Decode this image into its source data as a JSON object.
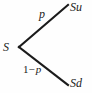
{
  "diagram": {
    "type": "binomial-one-step-tree",
    "background_color": "#fefefe",
    "line_color": "#1b1b1b",
    "text_color": "#1b1b1b",
    "nodes": {
      "root": "S",
      "up": "Su",
      "down": "Sd"
    },
    "branch_labels": {
      "up": "p",
      "down_prefix": "1−",
      "down_var": "p"
    },
    "geometry": {
      "vertex_x": 19,
      "vertex_y": 47,
      "up_end_x": 68,
      "up_end_y": 5,
      "down_end_x": 68,
      "down_end_y": 85,
      "stroke_width": 2.1
    }
  }
}
